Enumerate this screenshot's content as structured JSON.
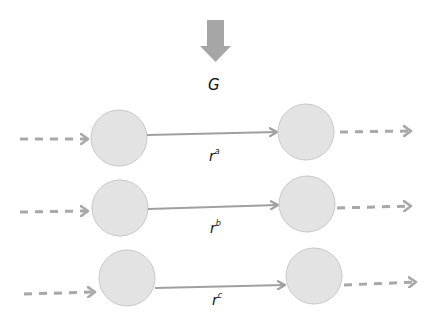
{
  "diagram": {
    "top_label": "G",
    "arrow_color": "#a6a6a6",
    "node_fill": "#e3e3e3",
    "node_stroke": "#c8c8c8",
    "edge_color": "#a0a0a0",
    "rows": [
      {
        "base": "r",
        "sup": "a"
      },
      {
        "base": "r",
        "sup": "b"
      },
      {
        "base": "r",
        "sup": "c"
      }
    ]
  }
}
